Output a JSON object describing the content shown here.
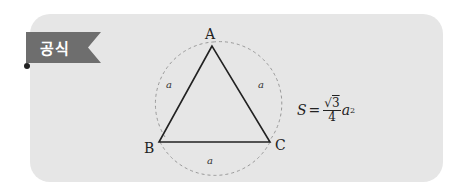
{
  "badge": {
    "label": "공식",
    "color": "#6e6e6e"
  },
  "card": {
    "background": "#e6e6e6"
  },
  "triangle": {
    "vertices": {
      "A": "A",
      "B": "B",
      "C": "C"
    },
    "side_labels": {
      "left": "a",
      "right": "a",
      "bottom": "a"
    },
    "type": "equilateral triangle with circumscribed dashed arcs"
  },
  "formula": {
    "lhs": "S",
    "equals": "=",
    "numerator": "3",
    "sqrt_symbol": "√",
    "denominator": "4",
    "variable": "a",
    "exponent": "2"
  }
}
